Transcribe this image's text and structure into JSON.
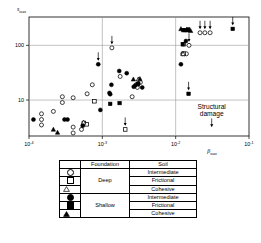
{
  "chart_data": {
    "type": "scatter",
    "title": "",
    "xlabel": "βmax",
    "ylabel": "smax",
    "xlabel_base": "β",
    "xlabel_sub": "max",
    "ylabel_base": "s",
    "ylabel_sub": "max",
    "xscale": "log",
    "yscale": "log",
    "xlim": [
      0.0001,
      0.1
    ],
    "ylim": [
      2.2,
      330
    ],
    "xticks": [
      {
        "value": 0.0001,
        "base": "10",
        "exp": "-4"
      },
      {
        "value": 0.001,
        "base": "10",
        "exp": "-3"
      },
      {
        "value": 0.01,
        "base": "10",
        "exp": "-2"
      },
      {
        "value": 0.1,
        "base": "10",
        "exp": "-1"
      }
    ],
    "yticks": [
      {
        "value": 100,
        "label": "100"
      },
      {
        "value": 10,
        "label": "10"
      }
    ],
    "gridlines_x": [
      0.001,
      0.01
    ],
    "gridlines_y": [
      100,
      10
    ],
    "grid": true,
    "legend_position": "below-plot",
    "annotations": [
      {
        "text": "Structural",
        "x": 0.031,
        "y": 6.8
      },
      {
        "text": "damage",
        "x": 0.031,
        "y": 5.2
      },
      {
        "text": "arrow-down",
        "x": 0.031,
        "y": 3.6
      }
    ],
    "series": [
      {
        "name": "Deep / Intermediate",
        "marker": "circle-open",
        "foundation": "Deep",
        "soil": "Intermediate",
        "points": [
          {
            "x": 0.000148,
            "y": 5.6
          },
          {
            "x": 0.000148,
            "y": 4.4
          },
          {
            "x": 0.000148,
            "y": 3.5
          },
          {
            "x": 0.000215,
            "y": 6.2
          },
          {
            "x": 0.000285,
            "y": 9.0
          },
          {
            "x": 0.000285,
            "y": 11.5
          },
          {
            "x": 0.0004,
            "y": 11.0
          },
          {
            "x": 0.0004,
            "y": 3.2
          },
          {
            "x": 0.0004,
            "y": 2.5
          },
          {
            "x": 0.00052,
            "y": 2.9
          },
          {
            "x": 0.00062,
            "y": 13.0
          },
          {
            "x": 0.00073,
            "y": 19.0
          },
          {
            "x": 0.00135,
            "y": 90.0,
            "arrow": true
          },
          {
            "x": 0.00175,
            "y": 27.0
          },
          {
            "x": 0.00255,
            "y": 11.5
          },
          {
            "x": 0.0029,
            "y": 19.0
          },
          {
            "x": 0.003,
            "y": 17.0
          },
          {
            "x": 0.0033,
            "y": 21.0
          },
          {
            "x": 0.0125,
            "y": 70.0
          },
          {
            "x": 0.0132,
            "y": 70.0
          },
          {
            "x": 0.014,
            "y": 70.0
          },
          {
            "x": 0.0152,
            "y": 100.0,
            "arrow": true
          },
          {
            "x": 0.0215,
            "y": 170.0,
            "arrow": true
          },
          {
            "x": 0.025,
            "y": 170.0,
            "arrow": true
          },
          {
            "x": 0.0295,
            "y": 170.0,
            "arrow": true
          }
        ]
      },
      {
        "name": "Deep / Frictional",
        "marker": "square-open",
        "foundation": "Deep",
        "soil": "Frictional",
        "points": [
          {
            "x": 0.00056,
            "y": 3.8
          },
          {
            "x": 0.00061,
            "y": 3.6
          },
          {
            "x": 0.00078,
            "y": 9.5
          },
          {
            "x": 0.00205,
            "y": 2.9,
            "arrow": true
          },
          {
            "x": 0.0128,
            "y": 70.0
          },
          {
            "x": 0.0128,
            "y": 105.0
          }
        ]
      },
      {
        "name": "Deep / Cohesive",
        "marker": "triangle-open",
        "foundation": "Deep",
        "soil": "Cohesive",
        "points": [
          {
            "x": 0.000555,
            "y": 3.9
          },
          {
            "x": 0.0031,
            "y": 24.0
          },
          {
            "x": 0.0126,
            "y": 70.0
          }
        ]
      },
      {
        "name": "Shallow / Intermediate",
        "marker": "circle-fill",
        "foundation": "Shallow",
        "soil": "Intermediate",
        "points": [
          {
            "x": 0.000115,
            "y": 4.4
          },
          {
            "x": 0.000305,
            "y": 4.4
          },
          {
            "x": 0.000335,
            "y": 4.4
          },
          {
            "x": 0.00054,
            "y": 3.4
          },
          {
            "x": 0.00088,
            "y": 45.0,
            "arrow": true
          },
          {
            "x": 0.00125,
            "y": 13.5
          },
          {
            "x": 0.00128,
            "y": 12.8
          },
          {
            "x": 0.00133,
            "y": 19.0
          },
          {
            "x": 0.0017,
            "y": 34.0
          },
          {
            "x": 0.00215,
            "y": 31.0
          },
          {
            "x": 0.00268,
            "y": 17.5
          },
          {
            "x": 0.00282,
            "y": 18.5
          },
          {
            "x": 0.0031,
            "y": 20.0
          },
          {
            "x": 0.0035,
            "y": 17.0
          },
          {
            "x": 0.00094,
            "y": 6.6
          },
          {
            "x": 0.0118,
            "y": 45.0
          },
          {
            "x": 0.0138,
            "y": 120.0
          }
        ]
      },
      {
        "name": "Shallow / Frictional",
        "marker": "square-fill",
        "foundation": "Shallow",
        "soil": "Frictional",
        "points": [
          {
            "x": 0.00128,
            "y": 8.5
          },
          {
            "x": 0.00172,
            "y": 8.8
          },
          {
            "x": 0.00305,
            "y": 19.5
          },
          {
            "x": 0.0125,
            "y": 105.0
          },
          {
            "x": 0.0128,
            "y": 190.0
          },
          {
            "x": 0.0134,
            "y": 190.0
          },
          {
            "x": 0.0148,
            "y": 195.0
          },
          {
            "x": 0.015,
            "y": 13.0,
            "arrow": true
          },
          {
            "x": 0.06,
            "y": 200.0,
            "arrow": true
          }
        ]
      },
      {
        "name": "Shallow / Cohesive",
        "marker": "triangle-fill",
        "foundation": "Shallow",
        "soil": "Cohesive",
        "points": [
          {
            "x": 0.000215,
            "y": 2.9
          },
          {
            "x": 0.000245,
            "y": 2.55
          },
          {
            "x": 0.00265,
            "y": 24.0
          },
          {
            "x": 0.00325,
            "y": 24.5
          },
          {
            "x": 0.0118,
            "y": 200.0
          },
          {
            "x": 0.0144,
            "y": 190.0
          },
          {
            "x": 0.016,
            "y": 185.0
          }
        ]
      }
    ]
  },
  "legend": {
    "headers": {
      "symbol": "",
      "foundation": "Foundation",
      "soil": "Soil"
    },
    "groups": [
      {
        "foundation": "Deep",
        "rows": [
          {
            "marker": "circle-open",
            "soil": "Intermediate"
          },
          {
            "marker": "square-open",
            "soil": "Frictional"
          },
          {
            "marker": "triangle-open",
            "soil": "Cohesive"
          }
        ]
      },
      {
        "foundation": "Shallow",
        "rows": [
          {
            "marker": "circle-fill",
            "soil": "Intermediate"
          },
          {
            "marker": "square-fill",
            "soil": "Frictional"
          },
          {
            "marker": "triangle-fill",
            "soil": "Cohesive"
          }
        ]
      }
    ]
  },
  "annotation_box": {
    "line1": "Structural",
    "line2": "damage"
  },
  "colors": {
    "marker": "#000000",
    "grid": "#9a9a9a",
    "axis": "#000000",
    "background": "#ffffff"
  }
}
